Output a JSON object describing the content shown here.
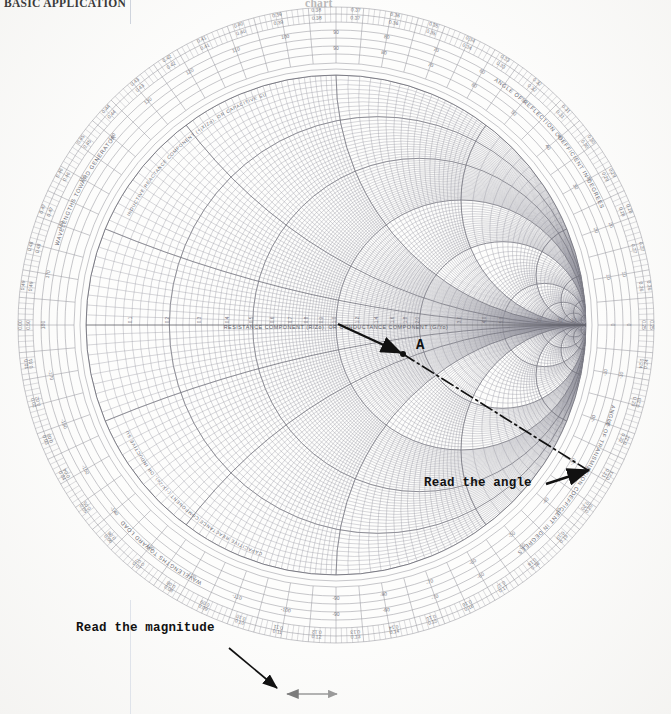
{
  "page": {
    "header_left": "BASIC APPLICATION",
    "header_right": "chart"
  },
  "chart": {
    "type": "smith-chart",
    "center_axis_label": "RESISTANCE COMPONENT (R/Zo), OR CONDUCTANCE COMPONENT (G/Yo)",
    "curved_labels": {
      "upper_left_outer": "WAVELENGTHS TOWARD GENERATOR",
      "lower_left_outer": "WAVELENGTHS TOWARD LOAD",
      "upper_right_outer": "ANGLE OF REFLECTION COEFFICIENT IN DEGREES",
      "lower_right_outer": "ANGLE OF TRANSMISSION COEFFICIENT IN DEGREES",
      "upper_left_inner": "INDUCTIVE REACTANCE COMPONENT (+jX/Zo), OR CAPACITIVE SUSCEPTANCE (+jB/Yo)",
      "lower_left_inner": "CAPACITIVE REACTANCE COMPONENT (-jX/Zo), OR INDUCTIVE SUSCEPTANCE (-jB/Yo)"
    },
    "wavelength_ticks_top": [
      "0.09",
      "0.10",
      "0.11",
      "0.12",
      "0.13",
      "0.14",
      "0.15",
      "0.16",
      "0.17",
      "0.18",
      "0.19"
    ],
    "wavelength_ticks_top_inner": [
      "0.41",
      "0.40",
      "0.39",
      "0.38",
      "0.37",
      "0.36",
      "0.35",
      "0.34",
      "0.33",
      "0.32",
      "0.31"
    ],
    "angle_ticks_top": [
      "100",
      "90",
      "80",
      "70",
      "60",
      "50",
      "40",
      "30",
      "20",
      "10"
    ],
    "angle_ticks_bottom": [
      "-100",
      "-90",
      "-80",
      "-70",
      "-60",
      "-50",
      "-40",
      "-30",
      "-20",
      "-10"
    ],
    "wavelength_ticks_bottom": [
      "0.09",
      "0.10",
      "0.11",
      "0.12",
      "0.13",
      "0.14",
      "0.15",
      "0.16",
      "0.17",
      "0.18",
      "0.19"
    ],
    "resistance_ticks": [
      "0.1",
      "0.2",
      "0.3",
      "0.4",
      "0.5",
      "0.6",
      "0.7",
      "0.8",
      "0.9",
      "1.0",
      "1.2",
      "1.4",
      "1.6",
      "1.8",
      "2.0",
      "3.0",
      "4.0",
      "5.0",
      "10",
      "20",
      "50"
    ],
    "reactance_ticks": [
      "0.2",
      "0.4",
      "0.6",
      "0.8",
      "1.0",
      "1.2",
      "1.4",
      "1.6",
      "1.8",
      "2.0",
      "3.0",
      "4.0",
      "5.0",
      "10",
      "20",
      "50"
    ],
    "rim_extremes": {
      "left_label": "0",
      "right_label": "∞",
      "center_label": "1.0"
    }
  },
  "annotations": {
    "point_label": "A",
    "read_angle": "Read the angle",
    "read_magnitude": "Read the magnitude",
    "point_a_coords": {
      "x": 400,
      "y": 352
    },
    "chart_center": {
      "x": 336,
      "y": 325
    },
    "rim_intersection": {
      "x": 582,
      "y": 467
    }
  },
  "colors": {
    "grid": "#8f8f96",
    "grid_light": "#b9b9c0",
    "annotation": "#111111",
    "ruler": "#9a9a9a",
    "paper": "#fdfdfc",
    "header_text": "#3a3a3a"
  }
}
